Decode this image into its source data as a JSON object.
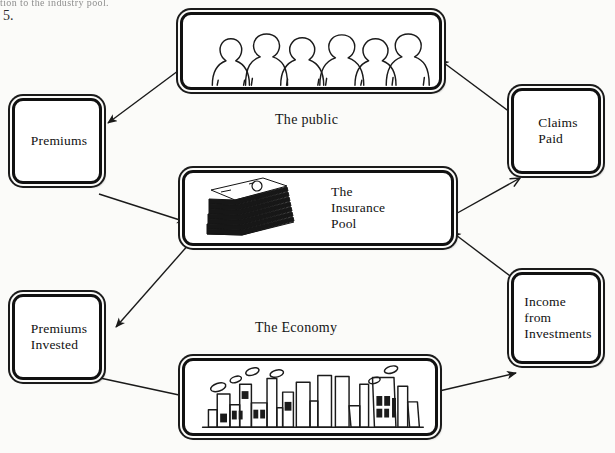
{
  "page": {
    "scan_header_text": "tion to the industry pool.",
    "list_number": "5.",
    "background_color": "#fbfbf9",
    "ink_color": "#1a1a1a"
  },
  "diagram": {
    "nodes": [
      {
        "id": "public",
        "label": "",
        "caption": "The public",
        "illustration": "crowd-of-people"
      },
      {
        "id": "pool",
        "label": "The\nInsurance\nPool",
        "caption": "",
        "illustration": "stack-of-banknotes"
      },
      {
        "id": "economy",
        "label": "",
        "caption": "The Economy",
        "illustration": "factories-skyline"
      },
      {
        "id": "premiums",
        "label": "Premiums",
        "caption": "",
        "illustration": "none"
      },
      {
        "id": "claims-paid",
        "label": "Claims\nPaid",
        "caption": "",
        "illustration": "none"
      },
      {
        "id": "premiums-invested",
        "label": "Premiums\nInvested",
        "caption": "",
        "illustration": "none"
      },
      {
        "id": "income",
        "label": "Income\nfrom\nInvestments",
        "caption": "",
        "illustration": "none"
      }
    ],
    "arrows": [
      {
        "id": "public-to-premiums",
        "from": "public",
        "to": "premiums"
      },
      {
        "id": "premiums-to-pool",
        "from": "premiums",
        "to": "pool"
      },
      {
        "id": "pool-to-claims",
        "from": "pool",
        "to": "claims-paid"
      },
      {
        "id": "claims-to-public",
        "from": "claims-paid",
        "to": "public"
      },
      {
        "id": "pool-to-premiums-invested",
        "from": "pool",
        "to": "premiums-invested"
      },
      {
        "id": "premiums-invested-to-economy",
        "from": "premiums-invested",
        "to": "economy"
      },
      {
        "id": "economy-to-income",
        "from": "economy",
        "to": "income"
      },
      {
        "id": "income-to-pool",
        "from": "income",
        "to": "pool"
      }
    ]
  }
}
